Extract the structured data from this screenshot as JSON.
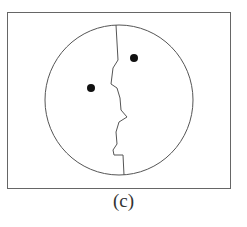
{
  "figure": {
    "caption": "(c)",
    "frame": {
      "x": 7,
      "y": 12,
      "width": 223,
      "height": 176
    },
    "circle": {
      "cx": 119,
      "cy": 100,
      "r": 74
    },
    "eyes": [
      {
        "cx": 134,
        "cy": 58,
        "r": 4
      },
      {
        "cx": 91,
        "cy": 88,
        "r": 4
      }
    ],
    "profile_path": "M116,25 L118,60 L113,68 L111,84 L117,88 L120,98 L121,110 L127,117 L119,122 L116,132 L117,144 L113,150 L114,155 L123,155 L124,175",
    "colors": {
      "stroke": "#555555",
      "fill": "#111111",
      "background": "#ffffff"
    }
  }
}
